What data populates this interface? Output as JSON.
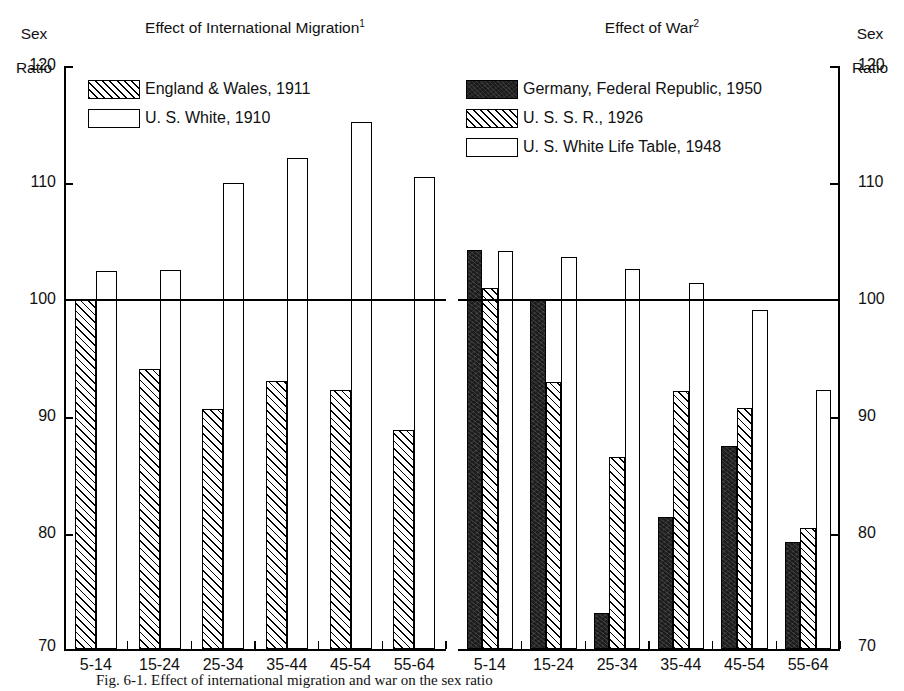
{
  "chart_data": {
    "type": "bar",
    "ylabel": "Sex Ratio",
    "xlabel": "",
    "ylim": [
      70,
      120
    ],
    "yticks": [
      70,
      80,
      90,
      100,
      110,
      120
    ],
    "grid": false,
    "reference_line": 100,
    "legend_position": "inside-top-left",
    "categories": [
      "5-14",
      "15-24",
      "25-34",
      "35-44",
      "45-54",
      "55-64"
    ],
    "panels": [
      {
        "title": "Effect of International Migration",
        "title_superscript": "1",
        "series": [
          {
            "name": "England & Wales, 1911",
            "fill": "hatch",
            "values": [
              100.0,
              94.0,
              90.6,
              93.0,
              92.2,
              88.8
            ]
          },
          {
            "name": "U. S. White, 1910",
            "fill": "open",
            "values": [
              102.4,
              102.5,
              110.0,
              112.1,
              115.2,
              110.5
            ]
          }
        ]
      },
      {
        "title": "Effect of War",
        "title_superscript": "2",
        "series": [
          {
            "name": "Germany, Federal Republic, 1950",
            "fill": "solid",
            "values": [
              104.2,
              100.0,
              73.1,
              81.3,
              87.4,
              79.2
            ]
          },
          {
            "name": "U. S. S. R., 1926",
            "fill": "hatch",
            "values": [
              101.0,
              92.9,
              86.5,
              92.1,
              90.7,
              80.4
            ]
          },
          {
            "name": "U. S. White Life Table, 1948",
            "fill": "open",
            "values": [
              104.1,
              103.6,
              102.6,
              101.4,
              99.1,
              92.2
            ]
          }
        ]
      }
    ]
  },
  "axis": {
    "name_line1": "Sex",
    "name_line2": "Ratio",
    "ticks": [
      "120",
      "110",
      "100",
      "90",
      "80",
      "70"
    ]
  },
  "left_panel": {
    "title": "Effect of International Migration",
    "title_sup": "1",
    "legend": [
      {
        "label": "England & Wales, 1911",
        "style": "hatch"
      },
      {
        "label": "U. S. White, 1910",
        "style": "open"
      }
    ],
    "categories": [
      "5-14",
      "15-24",
      "25-34",
      "35-44",
      "45-54",
      "55-64"
    ]
  },
  "right_panel": {
    "title": "Effect of War",
    "title_sup": "2",
    "legend": [
      {
        "label": "Germany, Federal Republic, 1950",
        "style": "solid"
      },
      {
        "label": "U. S. S. R., 1926",
        "style": "hatch"
      },
      {
        "label": "U. S. White Life Table, 1948",
        "style": "open"
      }
    ],
    "categories": [
      "5-14",
      "15-24",
      "25-34",
      "35-44",
      "45-54",
      "55-64"
    ]
  },
  "caption": "Fig. 6-1.  Effect of international migration and war on the sex ratio"
}
